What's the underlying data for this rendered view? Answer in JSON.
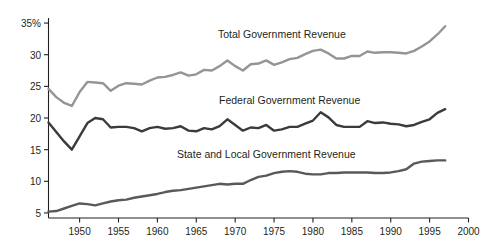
{
  "chart_data": {
    "type": "line",
    "title": "",
    "subtitle": "",
    "xlabel": "",
    "ylabel": "",
    "xlim": [
      1946,
      2000
    ],
    "ylim": [
      4.2,
      35.8
    ],
    "grid": false,
    "legend_position": "inline-labels",
    "y_axis": {
      "ticks": [
        5,
        10,
        15,
        20,
        25,
        30,
        35
      ],
      "tick_labels": [
        "5",
        "10",
        "15",
        "20",
        "25",
        "30",
        "35%"
      ],
      "unit": "percent"
    },
    "x_axis": {
      "ticks": [
        1950,
        1955,
        1960,
        1965,
        1970,
        1975,
        1980,
        1985,
        1990,
        1995,
        2000
      ],
      "tick_labels": [
        "1950",
        "1955",
        "1960",
        "1965",
        "1970",
        "1975",
        "1980",
        "1985",
        "1990",
        "1995",
        "2000"
      ],
      "data_start": 1946,
      "data_end": 1997
    },
    "x": [
      1946,
      1947,
      1948,
      1949,
      1950,
      1951,
      1952,
      1953,
      1954,
      1955,
      1956,
      1957,
      1958,
      1959,
      1960,
      1961,
      1962,
      1963,
      1964,
      1965,
      1966,
      1967,
      1968,
      1969,
      1970,
      1971,
      1972,
      1973,
      1974,
      1975,
      1976,
      1977,
      1978,
      1979,
      1980,
      1981,
      1982,
      1983,
      1984,
      1985,
      1986,
      1987,
      1988,
      1989,
      1990,
      1991,
      1992,
      1993,
      1994,
      1995,
      1996,
      1997
    ],
    "series": [
      {
        "name": "Total Government Revenue",
        "color": "#939597",
        "line_width": 2.4,
        "label_x": 1976,
        "label_y": 33.2,
        "values": [
          24.6,
          23.3,
          22.4,
          21.9,
          24.1,
          25.7,
          25.6,
          25.5,
          24.3,
          25.1,
          25.5,
          25.4,
          25.3,
          25.9,
          26.4,
          26.5,
          26.8,
          27.2,
          26.7,
          26.9,
          27.6,
          27.5,
          28.2,
          29.1,
          28.2,
          27.5,
          28.5,
          28.6,
          29.1,
          28.4,
          28.8,
          29.3,
          29.5,
          30.1,
          30.6,
          30.8,
          30.2,
          29.4,
          29.4,
          29.8,
          29.8,
          30.5,
          30.3,
          30.4,
          30.4,
          30.3,
          30.2,
          30.6,
          31.3,
          32.1,
          33.2,
          34.5
        ]
      },
      {
        "name": "Federal Government Revenue",
        "color": "#3b3b3d",
        "line_width": 2.4,
        "label_x": 1977,
        "label_y": 22.8,
        "values": [
          19.3,
          17.8,
          16.3,
          15.0,
          17.1,
          19.2,
          20.0,
          19.8,
          18.5,
          18.6,
          18.6,
          18.4,
          17.9,
          18.4,
          18.6,
          18.3,
          18.4,
          18.7,
          18.0,
          17.9,
          18.4,
          18.2,
          18.7,
          19.8,
          18.9,
          18.0,
          18.5,
          18.4,
          18.9,
          18.0,
          18.2,
          18.6,
          18.6,
          19.1,
          19.6,
          20.9,
          20.1,
          18.9,
          18.6,
          18.6,
          18.6,
          19.5,
          19.2,
          19.3,
          19.1,
          19.0,
          18.7,
          18.9,
          19.4,
          19.8,
          20.8,
          21.4
        ]
      },
      {
        "name": "State and Local Government Revenue",
        "color": "#58595b",
        "line_width": 2.4,
        "label_x": 1974,
        "label_y": 14.3,
        "values": [
          5.2,
          5.3,
          5.7,
          6.1,
          6.5,
          6.4,
          6.2,
          6.5,
          6.8,
          7.0,
          7.1,
          7.4,
          7.6,
          7.8,
          8.0,
          8.3,
          8.5,
          8.6,
          8.8,
          9.0,
          9.2,
          9.4,
          9.6,
          9.5,
          9.6,
          9.6,
          10.2,
          10.7,
          10.9,
          11.3,
          11.5,
          11.6,
          11.5,
          11.2,
          11.1,
          11.1,
          11.3,
          11.3,
          11.4,
          11.4,
          11.4,
          11.4,
          11.3,
          11.3,
          11.4,
          11.6,
          11.9,
          12.8,
          13.1,
          13.2,
          13.3,
          13.3
        ]
      }
    ],
    "axis_color": "#231f20"
  }
}
